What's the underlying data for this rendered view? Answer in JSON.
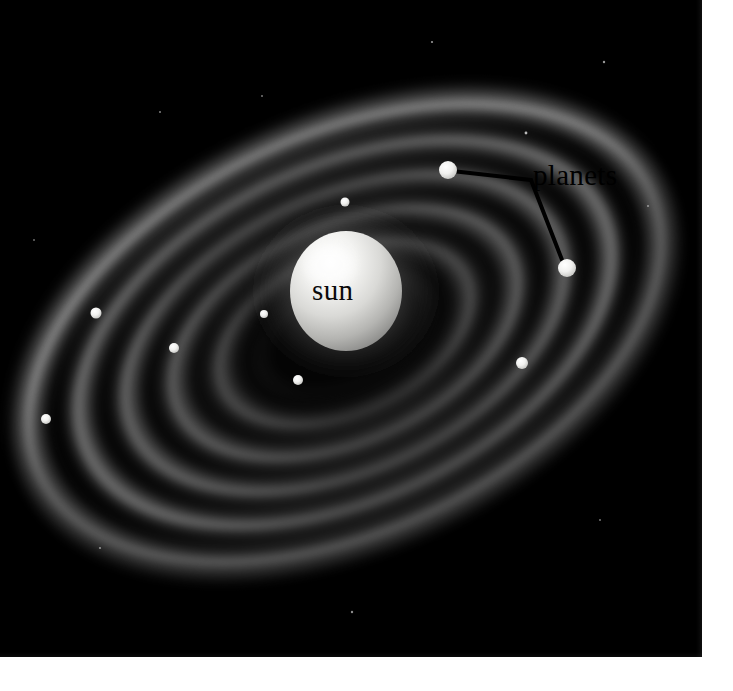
{
  "illustration": {
    "subject": "solar-system-disk",
    "background_color": "#000000",
    "page_color": "#ffffff",
    "plate": {
      "x": 0,
      "y": 0,
      "width": 702,
      "height": 657
    }
  },
  "labels": {
    "sun": "sun",
    "planets": "planets"
  },
  "sun": {
    "label": "sun",
    "center_x": 346,
    "center_y": 291,
    "radius_x": 56,
    "radius_y": 60,
    "color": "#e8e8e6",
    "highlight_color": "#ffffff",
    "shadow_color": "#8d8d8b"
  },
  "disk": {
    "center_x": 345,
    "center_y": 333,
    "rotation_deg": -25,
    "outer_radius_x": 350,
    "outer_radius_y": 206,
    "ring_color": "#9b9b9b",
    "gap_color": "#141414",
    "ring_count": 5,
    "rings": [
      {
        "name": "ring-1-inner",
        "rx": 140,
        "ry": 82,
        "brightness": 0.46
      },
      {
        "name": "ring-2",
        "rx": 196,
        "ry": 115,
        "brightness": 0.6
      },
      {
        "name": "ring-3",
        "rx": 248,
        "ry": 146,
        "brightness": 0.66
      },
      {
        "name": "ring-4",
        "rx": 300,
        "ry": 176,
        "brightness": 0.72
      },
      {
        "name": "ring-5-outer",
        "rx": 348,
        "ry": 204,
        "brightness": 0.58
      }
    ]
  },
  "planets": {
    "label": "planets",
    "label_x": 533,
    "label_y": 159,
    "callout_color": "#000000",
    "callout_width": 4,
    "callout_vertex": {
      "x": 531,
      "y": 180
    },
    "labelled": [
      {
        "name": "planet-upper-right",
        "x": 448,
        "y": 170,
        "r": 9,
        "color": "#f2f2f0"
      },
      {
        "name": "planet-right",
        "x": 567,
        "y": 268,
        "r": 9,
        "color": "#f2f2f0"
      }
    ],
    "unlabelled": [
      {
        "name": "planet-dot-1",
        "x": 345,
        "y": 202,
        "r": 4.5,
        "color": "#e6e6e4"
      },
      {
        "name": "planet-dot-2",
        "x": 264,
        "y": 314,
        "r": 4.0,
        "color": "#e3e3e1"
      },
      {
        "name": "planet-dot-3",
        "x": 298,
        "y": 380,
        "r": 5.0,
        "color": "#ebebe9"
      },
      {
        "name": "planet-dot-4",
        "x": 174,
        "y": 348,
        "r": 5.0,
        "color": "#e9e9e7"
      },
      {
        "name": "planet-dot-5",
        "x": 96,
        "y": 313,
        "r": 5.5,
        "color": "#ededeb"
      },
      {
        "name": "planet-dot-6",
        "x": 46,
        "y": 419,
        "r": 5.0,
        "color": "#e4e4e2"
      },
      {
        "name": "planet-dot-7",
        "x": 522,
        "y": 363,
        "r": 6.0,
        "color": "#f0f0ee"
      }
    ]
  },
  "stars": [
    {
      "x": 526,
      "y": 133,
      "r": 1.4
    },
    {
      "x": 432,
      "y": 42,
      "r": 1.1
    },
    {
      "x": 160,
      "y": 112,
      "r": 1.0
    },
    {
      "x": 604,
      "y": 62,
      "r": 1.2
    },
    {
      "x": 648,
      "y": 206,
      "r": 1.0
    },
    {
      "x": 100,
      "y": 548,
      "r": 1.1
    },
    {
      "x": 352,
      "y": 612,
      "r": 1.2
    },
    {
      "x": 600,
      "y": 520,
      "r": 1.0
    },
    {
      "x": 34,
      "y": 240,
      "r": 1.0
    },
    {
      "x": 262,
      "y": 96,
      "r": 1.0
    }
  ]
}
